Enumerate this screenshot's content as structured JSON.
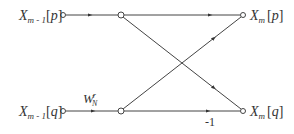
{
  "diagram": {
    "type": "butterfly-flow-graph",
    "line_color": "#444444",
    "background": "#ffffff",
    "inputs": [
      {
        "id": "p",
        "base": "X",
        "subscript": "m - 1",
        "index": "p"
      },
      {
        "id": "q",
        "base": "X",
        "subscript": "m - 1",
        "index": "q"
      }
    ],
    "outputs": [
      {
        "id": "p",
        "base": "X",
        "subscript": "m",
        "index": "p"
      },
      {
        "id": "q",
        "base": "X",
        "subscript": "m",
        "index": "q"
      }
    ],
    "twiddle": {
      "base": "W",
      "subscript": "N",
      "superscript": "r"
    },
    "gain_label": "-1"
  }
}
